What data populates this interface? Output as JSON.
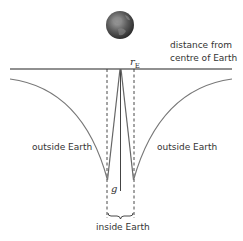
{
  "diagram": {
    "axis_label_line1": "distance from",
    "axis_label_line2": "centre of Earth",
    "radius_symbol": "r",
    "radius_subscript": "E",
    "g_symbol": "g",
    "region_left": "outside Earth",
    "region_right": "outside Earth",
    "region_inside": "inside Earth",
    "earth_icon": "earth-globe-icon",
    "colors": {
      "axis": "#222222",
      "curve": "#777777",
      "dashed": "#333333",
      "earth_dark": "#3a3a3a",
      "earth_light": "#9a9a9a"
    }
  }
}
